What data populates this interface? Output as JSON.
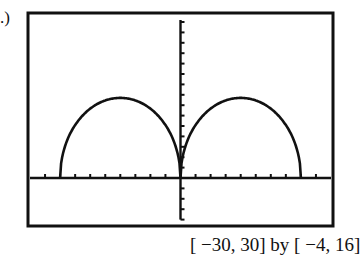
{
  "part_label": ".)",
  "caption": "[ −30, 30] by [ −4, 16]",
  "chart_data": {
    "type": "line",
    "title": "",
    "xlabel": "",
    "ylabel": "",
    "xlim": [
      -30,
      30
    ],
    "ylim": [
      -4,
      16
    ],
    "xscl": 3,
    "yscl": 1,
    "grid": false,
    "series": [
      {
        "name": "graph",
        "x": [
          -24,
          -22,
          -20,
          -18,
          -16,
          -14,
          -12,
          -10,
          -8,
          -6,
          -4,
          -2,
          0,
          2,
          4,
          6,
          8,
          10,
          12,
          14,
          16,
          18,
          20,
          22,
          24
        ],
        "y": [
          0,
          3.1,
          4.9,
          6.1,
          7.0,
          7.5,
          7.7,
          7.5,
          7.0,
          6.1,
          4.9,
          3.1,
          0,
          3.1,
          4.9,
          6.1,
          7.0,
          7.5,
          7.7,
          7.5,
          7.0,
          6.1,
          4.9,
          3.1,
          0
        ]
      }
    ],
    "window_caption": "[-30, 30] by [-4, 16]"
  }
}
